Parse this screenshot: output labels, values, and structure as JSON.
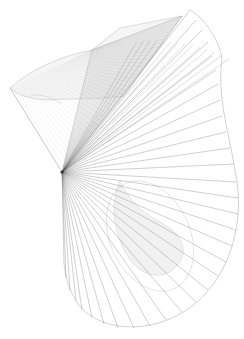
{
  "figure": {
    "width": 244,
    "height": 339,
    "background": "#ffffff",
    "focal_point": [
      62,
      172
    ],
    "fan": {
      "stroke": "#6e6e6e",
      "stroke_opacity": 0.55,
      "stroke_width": 0.6,
      "endpoints": [
        [
          190,
          10
        ],
        [
          196,
          20
        ],
        [
          202,
          30
        ],
        [
          208,
          42
        ],
        [
          212,
          56
        ],
        [
          216,
          70
        ],
        [
          218,
          84
        ],
        [
          220,
          100
        ],
        [
          222,
          116
        ],
        [
          226,
          132
        ],
        [
          230,
          148
        ],
        [
          234,
          164
        ],
        [
          236,
          182
        ],
        [
          238,
          198
        ],
        [
          238,
          214
        ],
        [
          236,
          230
        ],
        [
          232,
          246
        ],
        [
          226,
          262
        ],
        [
          218,
          276
        ],
        [
          208,
          290
        ],
        [
          196,
          302
        ],
        [
          182,
          312
        ],
        [
          166,
          320
        ],
        [
          150,
          326
        ],
        [
          134,
          328
        ],
        [
          118,
          328
        ],
        [
          104,
          324
        ],
        [
          92,
          318
        ],
        [
          82,
          310
        ],
        [
          76,
          300
        ],
        [
          70,
          290
        ],
        [
          66,
          278
        ],
        [
          64,
          264
        ]
      ],
      "outer_boundary": "M190,10 C204,18 220,40 222,60 L222,60 C216,100 232,140 238,190 C242,240 222,290 180,314 C140,336 96,328 78,304 C70,292 66,280 64,264"
    },
    "ribbon": {
      "stroke": "#9a9a9a",
      "stroke_opacity": 0.45,
      "fill": "#d8d8d8",
      "fill_opacity": 0.25,
      "hatch_color": "#8a8a8a",
      "back_face": "M10,88 C30,70 60,56 92,50 L120,28 L182,16 L124,96 C100,100 70,98 50,100 C34,100 18,96 10,88 Z",
      "side_face": "M92,50 L62,172 L124,96 L182,16 Z",
      "front_edge": "M10,88 L62,172",
      "inner_curve": "M30,96 C40,92 56,100 62,104",
      "lower_fold": "M120,180 C112,200 110,230 130,260 C146,280 168,280 180,262 C190,246 176,230 160,222 C140,212 126,196 120,180 Z"
    },
    "hatch_lines": {
      "count": 40,
      "from_edge": [
        [
          62,
          172
        ],
        [
          182,
          16
        ]
      ],
      "to_edge": [
        [
          10,
          88
        ],
        [
          92,
          50
        ]
      ]
    },
    "ellipse": {
      "cx": 150,
      "cy": 236,
      "rx": 40,
      "ry": 58,
      "rotate": -25,
      "stroke": "#9a9a9a",
      "stroke_opacity": 0.35
    }
  }
}
